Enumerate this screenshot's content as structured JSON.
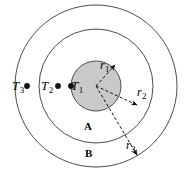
{
  "figure": {
    "type": "concentric-circles-heat-conduction-diagram",
    "background_color": "#ffffff",
    "stroke_color": "#4d4d4d",
    "inner_fill_color": "#c9c9c9",
    "center": {
      "x": 96,
      "y": 86
    }
  },
  "circles": [
    {
      "name": "inner-core",
      "radius": 25,
      "filled": true,
      "fill": "#c9c9c9"
    },
    {
      "name": "middle-boundary",
      "radius": 57,
      "filled": false
    },
    {
      "name": "outer-boundary",
      "radius": 81,
      "filled": false
    }
  ],
  "temperature_labels": [
    {
      "id": "T3",
      "text": "T",
      "sub": "3",
      "x": 12,
      "y": 78,
      "dot_x": 27,
      "dot_y": 86
    },
    {
      "id": "T2",
      "text": "T",
      "sub": "2",
      "x": 43,
      "y": 78,
      "dot_x": 58,
      "dot_y": 86
    },
    {
      "id": "T1",
      "text": "T",
      "sub": "1",
      "x": 56,
      "y": 78,
      "dot_x": 71,
      "dot_y": 86
    }
  ],
  "radius_labels": [
    {
      "id": "r1",
      "text": "r",
      "sub": "1",
      "x": 100,
      "y": 58,
      "arrow_to_x": 117,
      "arrow_to_y": 66
    },
    {
      "id": "r2",
      "text": "r",
      "sub": "2",
      "x": 138,
      "y": 84,
      "arrow_to_x": 140,
      "arrow_to_y": 107
    },
    {
      "id": "r3",
      "text": "r",
      "sub": "3",
      "x": 127,
      "y": 139,
      "arrow_to_x": 140,
      "arrow_to_y": 158
    }
  ],
  "region_labels": [
    {
      "id": "A",
      "text": "A",
      "x": 83,
      "y": 121,
      "description": "inner annular region between r1 and r2"
    },
    {
      "id": "B",
      "text": "B",
      "x": 84,
      "y": 148,
      "description": "outer annular region between r2 and r3"
    }
  ]
}
